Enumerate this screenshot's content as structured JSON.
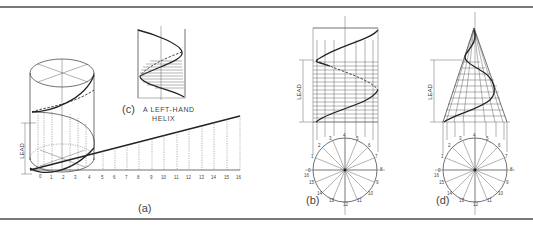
{
  "figure": {
    "panels": [
      {
        "id": "a",
        "caption": "(a)",
        "dimension_label": "LEAD",
        "development_numbers": [
          "0",
          "1",
          "2",
          "3",
          "4",
          "5",
          "6",
          "7",
          "8",
          "9",
          "10",
          "11",
          "12",
          "13",
          "14",
          "15",
          "16"
        ]
      },
      {
        "id": "b",
        "caption": "(b)",
        "dimension_label": "LEAD",
        "circle_numbers": [
          "0",
          "1",
          "2",
          "3",
          "4",
          "5",
          "6",
          "7",
          "8",
          "9",
          "10",
          "11",
          "12",
          "13",
          "14",
          "15",
          "16"
        ]
      },
      {
        "id": "c",
        "caption": "(c)",
        "caption_text_line1": "A LEFT-HAND",
        "caption_text_line2": "HELIX"
      },
      {
        "id": "d",
        "caption": "(d)",
        "dimension_label": "LEAD",
        "circle_numbers": [
          "0",
          "1",
          "2",
          "3",
          "4",
          "5",
          "6",
          "7",
          "8",
          "9",
          "10",
          "11",
          "12",
          "13",
          "14",
          "15",
          "16"
        ]
      }
    ]
  },
  "colors": {
    "line": "#333333",
    "frame": "#7a7a7a",
    "background": "#ffffff"
  }
}
